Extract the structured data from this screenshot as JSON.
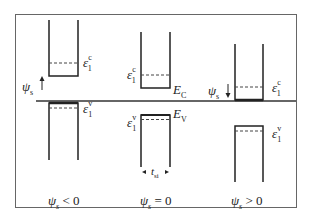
{
  "diagram": {
    "type": "quantum-well energy band diagram",
    "frame": {
      "x": 15,
      "y": 14,
      "width": 282,
      "height": 194,
      "border_color": "#555555"
    },
    "divider": {
      "y": 101,
      "x1": 36,
      "x2": 296
    },
    "panels": [
      {
        "id": "negative",
        "caption": {
          "symbol": "ψ",
          "subscript": "s",
          "relation": " < 0"
        },
        "surface_potential_arrow": {
          "label_symbol": "ψ",
          "label_subscript": "s",
          "direction": "up"
        },
        "conduction_well": {
          "level_symbol": "ε",
          "level_sub": "1",
          "level_sup": "c"
        },
        "valence_well": {
          "level_symbol": "ε",
          "level_sub": "1",
          "level_sup": "v"
        }
      },
      {
        "id": "zero",
        "caption": {
          "symbol": "ψ",
          "subscript": "s",
          "relation": " = 0"
        },
        "conduction_well": {
          "level_symbol": "ε",
          "level_sub": "1",
          "level_sup": "c",
          "edge_label": "E",
          "edge_sub": "C"
        },
        "valence_well": {
          "level_symbol": "ε",
          "level_sub": "1",
          "level_sup": "v",
          "edge_label": "E",
          "edge_sub": "V"
        },
        "thickness_label": {
          "symbol": "t",
          "subscript": "si"
        }
      },
      {
        "id": "positive",
        "caption": {
          "symbol": "ψ",
          "subscript": "s",
          "relation": " > 0"
        },
        "surface_potential_arrow": {
          "label_symbol": "ψ",
          "label_subscript": "s",
          "direction": "down"
        },
        "conduction_well": {
          "level_symbol": "ε",
          "level_sub": "1",
          "level_sup": "c"
        },
        "valence_well": {
          "level_symbol": "ε",
          "level_sub": "1",
          "level_sup": "v"
        }
      }
    ]
  }
}
